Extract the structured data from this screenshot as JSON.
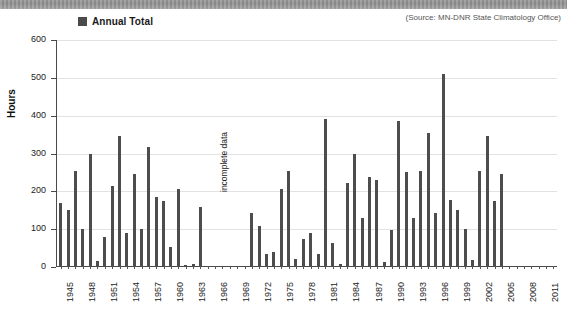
{
  "legend": {
    "label": "Annual Total",
    "swatch_color": "#4a4a4a"
  },
  "source_note": "(Source: MN-DNR State Climatology Office)",
  "annotation": {
    "incomplete_data": "incomplete data"
  },
  "axis": {
    "ylabel": "Hours"
  },
  "chart_data": {
    "type": "bar",
    "title": "",
    "subtitle": "",
    "xlabel": "",
    "ylabel": "Hours",
    "ylim": [
      0,
      600
    ],
    "ytick_values": [
      0,
      100,
      200,
      300,
      400,
      500,
      600
    ],
    "ytick_labels": [
      "0",
      "100",
      "200",
      "300",
      "400",
      "500",
      "600"
    ],
    "grid": true,
    "legend_position": "top-left",
    "series": [
      {
        "name": "Annual Total",
        "color": "#4d4d4d",
        "categories": [
          "1945",
          "1946",
          "1947",
          "1948",
          "1949",
          "1950",
          "1951",
          "1952",
          "1953",
          "1954",
          "1955",
          "1956",
          "1957",
          "1958",
          "1959",
          "1960",
          "1961",
          "1962",
          "1963",
          "1964",
          "1965",
          "1966",
          "1967",
          "1968",
          "1969",
          "1970",
          "1971",
          "1972",
          "1973",
          "1974",
          "1975",
          "1976",
          "1977",
          "1978",
          "1979",
          "1980",
          "1981",
          "1982",
          "1983",
          "1984",
          "1985",
          "1986",
          "1987",
          "1988",
          "1989",
          "1990",
          "1991",
          "1992",
          "1993",
          "1994",
          "1995",
          "1996",
          "1997",
          "1998",
          "1999",
          "2000",
          "2001",
          "2002",
          "2003",
          "2004",
          "2005",
          "2006",
          "2007",
          "2008",
          "2009",
          "2010",
          "2011",
          "2012"
        ],
        "values": [
          170,
          150,
          255,
          100,
          300,
          15,
          80,
          215,
          345,
          90,
          245,
          100,
          318,
          186,
          175,
          52,
          205,
          6,
          8,
          158,
          0,
          0,
          0,
          0,
          0,
          4,
          143,
          108,
          35,
          40,
          205,
          253,
          20,
          75,
          90,
          35,
          392,
          64,
          8,
          222,
          300,
          130,
          237,
          230,
          14,
          97,
          385,
          252,
          130,
          255,
          355,
          142,
          510,
          178,
          152,
          100,
          18,
          255,
          345,
          175,
          245,
          0,
          0,
          0,
          0,
          0,
          0,
          0
        ],
        "xtick_labels": [
          "1945",
          "1948",
          "1951",
          "1954",
          "1957",
          "1960",
          "1963",
          "1966",
          "1969",
          "1972",
          "1975",
          "1978",
          "1981",
          "1984",
          "1987",
          "1990",
          "1993",
          "1996",
          "1999",
          "2002",
          "2005",
          "2008",
          "2011"
        ],
        "gap_note": "incomplete data"
      }
    ]
  }
}
